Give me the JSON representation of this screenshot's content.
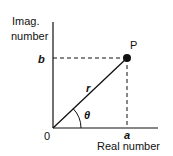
{
  "diagram": {
    "y_axis_label_line1": "Imag.",
    "y_axis_label_line2": "number",
    "x_axis_label": "Real number",
    "origin_label": "0",
    "point_label": "P",
    "y_projection_label": "b",
    "x_projection_label": "a",
    "radius_label": "r",
    "angle_label": "θ",
    "colors": {
      "stroke": "#111111",
      "background": "#ffffff"
    }
  }
}
